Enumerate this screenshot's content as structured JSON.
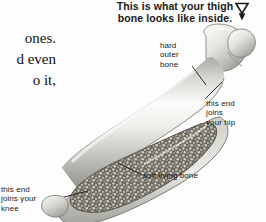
{
  "page": {
    "background_color": "#fdfdfd",
    "text_color": "#1a1a1a"
  },
  "body_copy": {
    "lines": [
      "ones.",
      "d even",
      "o it,"
    ]
  },
  "heading": {
    "line1": "This is what your thigh",
    "line2": "bone looks like inside.",
    "marker_icon": "double-down-triangle-icon"
  },
  "labels": {
    "hard_outer_bone": {
      "line1": "hard",
      "line2": "outer",
      "line3": "bone"
    },
    "joins_hip": {
      "line1": "this end",
      "line2": "joins",
      "line3": "your hip"
    },
    "joins_knee": {
      "line1": "this end",
      "line2": "joins your",
      "line3": "knee"
    },
    "soft_living_bone": {
      "line1": "soft living bone"
    }
  },
  "figure": {
    "name": "femur-cutaway-illustration",
    "colors": {
      "cortical_light": "#f2f2f0",
      "cortical_mid": "#c9c9c6",
      "cortical_dark": "#8e8e8a",
      "marrow_dark": "#58544e",
      "marrow_mid": "#7d786f",
      "outline": "#6b6b67"
    }
  }
}
